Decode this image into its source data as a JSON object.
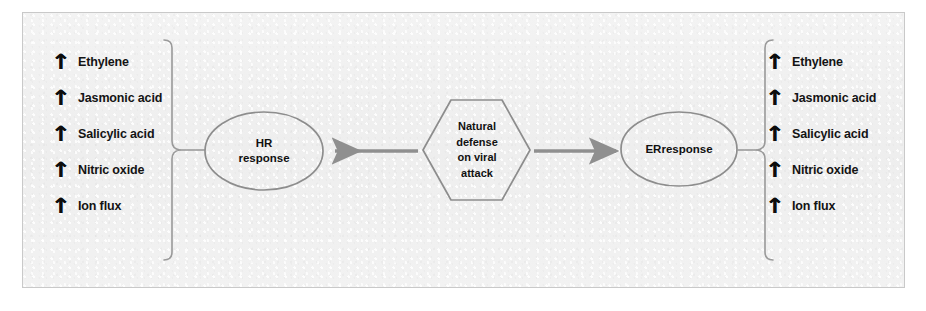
{
  "figure": {
    "background_color": "#f1f1f1",
    "border_color": "#c9c9c9",
    "stroke_color": "#8a8a8a",
    "text_color": "#141414"
  },
  "center_node": {
    "shape": "hexagon",
    "lines": [
      "Natural",
      "defense",
      "on viral",
      "attack"
    ]
  },
  "left_branch": {
    "node": {
      "shape": "ellipse",
      "lines": [
        "HR",
        "response"
      ]
    },
    "arrow": {
      "name": "arrow-left",
      "direction": "left"
    },
    "bracket": {
      "name": "bracket-left",
      "orientation": "opens-left"
    },
    "items": [
      {
        "icon": "up-arrow-icon",
        "glyph": "↑",
        "label": "Ethylene"
      },
      {
        "icon": "up-arrow-icon",
        "glyph": "↑",
        "label": "Jasmonic acid"
      },
      {
        "icon": "up-arrow-icon",
        "glyph": "↑",
        "label": "Salicylic acid"
      },
      {
        "icon": "up-arrow-icon",
        "glyph": "↑",
        "label": "Nitric oxide"
      },
      {
        "icon": "up-arrow-icon",
        "glyph": "↑",
        "label": "Ion flux"
      }
    ]
  },
  "right_branch": {
    "node": {
      "shape": "ellipse",
      "lines": [
        "ERresponse"
      ]
    },
    "arrow": {
      "name": "arrow-right",
      "direction": "right"
    },
    "bracket": {
      "name": "bracket-right",
      "orientation": "opens-right"
    },
    "items": [
      {
        "icon": "up-arrow-icon",
        "glyph": "↑",
        "label": "Ethylene"
      },
      {
        "icon": "up-arrow-icon",
        "glyph": "↑",
        "label": "Jasmonic acid"
      },
      {
        "icon": "up-arrow-icon",
        "glyph": "↑",
        "label": "Salicylic acid"
      },
      {
        "icon": "up-arrow-icon",
        "glyph": "↑",
        "label": "Nitric oxide"
      },
      {
        "icon": "up-arrow-icon",
        "glyph": "↑",
        "label": "Ion flux"
      }
    ]
  }
}
